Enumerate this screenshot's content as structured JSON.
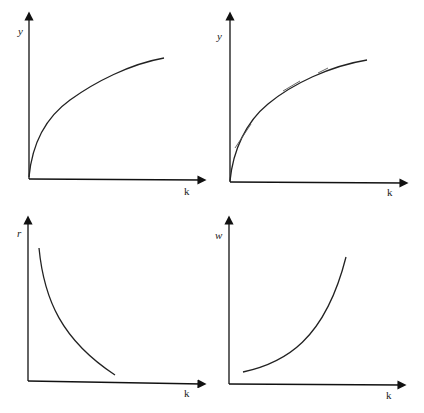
{
  "figure": {
    "panels": [
      {
        "id": "top-left",
        "title": "",
        "y_axis_label": "y",
        "x_axis_label": "k",
        "curve": "concave increasing production function y = f(k)"
      },
      {
        "id": "top-right",
        "title": "",
        "y_axis_label": "y",
        "x_axis_label": "k",
        "curve": "concave increasing production function with tangent lines (marginal product slopes)",
        "tangent_count": 3
      },
      {
        "id": "bottom-left",
        "title": "",
        "y_axis_label": "r",
        "x_axis_label": "k",
        "curve": "decreasing convex curve (rental rate falls as k rises)"
      },
      {
        "id": "bottom-right",
        "title": "",
        "y_axis_label": "w",
        "x_axis_label": "k",
        "curve": "increasing convex curve (wage rises as k rises)"
      }
    ]
  },
  "colors": {
    "axis": "#111111",
    "curve": "#222222",
    "tangent": "#555555",
    "background": "#ffffff"
  }
}
